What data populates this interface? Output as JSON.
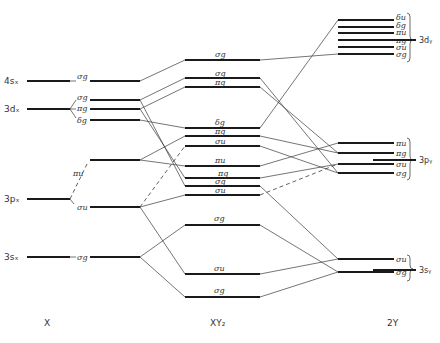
{
  "columns": {
    "left": "X",
    "center": "XY₂",
    "right": "2Y"
  },
  "atom_x_levels": [
    {
      "label": "4sₓ",
      "y": 81
    },
    {
      "label": "3dₓ",
      "y": 109
    },
    {
      "label": "3pₓ",
      "y": 199
    },
    {
      "label": "3sₓ",
      "y": 257
    }
  ],
  "x_split_levels": [
    {
      "label": "σg",
      "y": 81
    },
    {
      "label": "σg",
      "y": 100
    },
    {
      "label": "πg",
      "y": 109
    },
    {
      "label": "δg",
      "y": 120
    },
    {
      "label": "πu",
      "y": 160
    },
    {
      "label": "σu",
      "y": 207
    },
    {
      "label": "σg",
      "y": 257
    }
  ],
  "molecule_levels": [
    {
      "label": "σg",
      "y": 60
    },
    {
      "label": "σg",
      "y": 78
    },
    {
      "label": "πg",
      "y": 87
    },
    {
      "label": "δg",
      "y": 128
    },
    {
      "label": "πg",
      "y": 136
    },
    {
      "label": "σu",
      "y": 146
    },
    {
      "label": "πu",
      "y": 166
    },
    {
      "label": "πg",
      "y": 178
    },
    {
      "label": "σg",
      "y": 186
    },
    {
      "label": "σu",
      "y": 195
    },
    {
      "label": "σg",
      "y": 225
    },
    {
      "label": "σu",
      "y": 274
    },
    {
      "label": "σg",
      "y": 297
    }
  ],
  "y_split_levels": [
    {
      "label": "δu",
      "y": 20
    },
    {
      "label": "δg",
      "y": 27
    },
    {
      "label": "πu",
      "y": 33
    },
    {
      "label": "πg",
      "y": 40
    },
    {
      "label": "σu",
      "y": 47
    },
    {
      "label": "σg",
      "y": 54
    },
    {
      "label": "πu",
      "y": 143
    },
    {
      "label": "πg",
      "y": 153
    },
    {
      "label": "σu",
      "y": 164
    },
    {
      "label": "σg",
      "y": 173
    },
    {
      "label": "σu",
      "y": 259
    },
    {
      "label": "σg",
      "y": 272
    }
  ],
  "atom_y_levels": [
    {
      "label": "3dᵧ",
      "y": 40
    },
    {
      "label": "3pᵧ",
      "y": 160
    },
    {
      "label": "3sᵧ",
      "y": 270
    }
  ],
  "colors": {
    "line": "#1a1a1a",
    "connector": "#3a3a3a",
    "text": "#333333",
    "background": "#ffffff"
  }
}
